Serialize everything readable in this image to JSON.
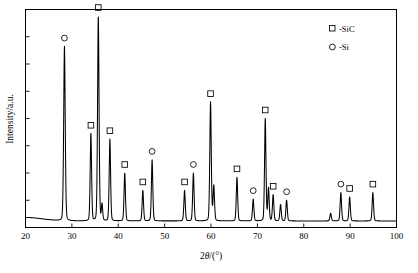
{
  "chart_data": {
    "type": "line",
    "title": "",
    "xlabel": "2θ/(°)",
    "ylabel": "Intensity/a.u.",
    "xlim": [
      20,
      100
    ],
    "ylim": [
      0,
      1
    ],
    "grid": false,
    "xticks": [
      20,
      30,
      40,
      50,
      60,
      70,
      80,
      90,
      100
    ],
    "xtick_labels": [
      "20",
      "30",
      "40",
      "50",
      "60",
      "70",
      "80",
      "90",
      "100"
    ],
    "ytick_count": 7,
    "ytick_labels": [],
    "legend_position": "top-right",
    "legend": [
      {
        "marker": "square",
        "label": "-SiC"
      },
      {
        "marker": "circle",
        "label": "-Si"
      }
    ],
    "series": [
      {
        "name": "XRD intensity",
        "peaks": [
          {
            "x": 28.4,
            "y": 0.8,
            "width": 0.42,
            "phase": "Si",
            "marker": "circle",
            "labeled": true
          },
          {
            "x": 34.1,
            "y": 0.4,
            "width": 0.38,
            "phase": "SiC",
            "marker": "square",
            "labeled": true
          },
          {
            "x": 35.7,
            "y": 0.94,
            "width": 0.4,
            "phase": "SiC",
            "marker": "square",
            "labeled": true
          },
          {
            "x": 36.5,
            "y": 0.075,
            "width": 0.35,
            "phase": "SiC",
            "marker": "none",
            "labeled": false
          },
          {
            "x": 38.2,
            "y": 0.375,
            "width": 0.38,
            "phase": "SiC",
            "marker": "square",
            "labeled": true
          },
          {
            "x": 41.4,
            "y": 0.22,
            "width": 0.38,
            "phase": "SiC",
            "marker": "square",
            "labeled": true
          },
          {
            "x": 45.3,
            "y": 0.14,
            "width": 0.38,
            "phase": "SiC",
            "marker": "square",
            "labeled": true
          },
          {
            "x": 47.3,
            "y": 0.28,
            "width": 0.38,
            "phase": "Si",
            "marker": "circle",
            "labeled": true
          },
          {
            "x": 54.3,
            "y": 0.14,
            "width": 0.38,
            "phase": "SiC",
            "marker": "square",
            "labeled": true
          },
          {
            "x": 56.2,
            "y": 0.22,
            "width": 0.38,
            "phase": "Si",
            "marker": "circle",
            "labeled": true
          },
          {
            "x": 59.9,
            "y": 0.545,
            "width": 0.4,
            "phase": "SiC",
            "marker": "square",
            "labeled": true
          },
          {
            "x": 60.6,
            "y": 0.16,
            "width": 0.4,
            "phase": "SiC",
            "marker": "none",
            "labeled": false
          },
          {
            "x": 65.6,
            "y": 0.2,
            "width": 0.38,
            "phase": "SiC",
            "marker": "square",
            "labeled": true
          },
          {
            "x": 69.1,
            "y": 0.1,
            "width": 0.38,
            "phase": "Si",
            "marker": "circle",
            "labeled": true
          },
          {
            "x": 71.7,
            "y": 0.47,
            "width": 0.38,
            "phase": "SiC",
            "marker": "square",
            "labeled": true
          },
          {
            "x": 72.4,
            "y": 0.15,
            "width": 0.38,
            "phase": "SiC",
            "marker": "none",
            "labeled": false
          },
          {
            "x": 73.4,
            "y": 0.12,
            "width": 0.38,
            "phase": "SiC",
            "marker": "square",
            "labeled": true
          },
          {
            "x": 75.0,
            "y": 0.075,
            "width": 0.38,
            "phase": "SiC",
            "marker": "none",
            "labeled": false
          },
          {
            "x": 76.3,
            "y": 0.095,
            "width": 0.38,
            "phase": "Si",
            "marker": "circle",
            "labeled": true
          },
          {
            "x": 85.8,
            "y": 0.035,
            "width": 0.38,
            "phase": "SiC",
            "marker": "none",
            "labeled": false
          },
          {
            "x": 88.0,
            "y": 0.13,
            "width": 0.38,
            "phase": "Si",
            "marker": "circle",
            "labeled": true
          },
          {
            "x": 89.9,
            "y": 0.11,
            "width": 0.38,
            "phase": "SiC",
            "marker": "square",
            "labeled": true
          },
          {
            "x": 94.9,
            "y": 0.13,
            "width": 0.38,
            "phase": "SiC",
            "marker": "square",
            "labeled": true
          }
        ],
        "baseline": 0.03,
        "color": "#000000"
      }
    ]
  },
  "axes": {
    "x_title": "2θ/(°)",
    "x_title_prefix": "2",
    "x_title_theta": "θ",
    "x_title_suffix": "/(°)",
    "y_title": "Intensity/a.u."
  },
  "legend": {
    "sic_label": "-SiC",
    "si_label": "-Si"
  },
  "colors": {
    "line": "#000000",
    "frame": "#000000",
    "background": "#ffffff"
  }
}
